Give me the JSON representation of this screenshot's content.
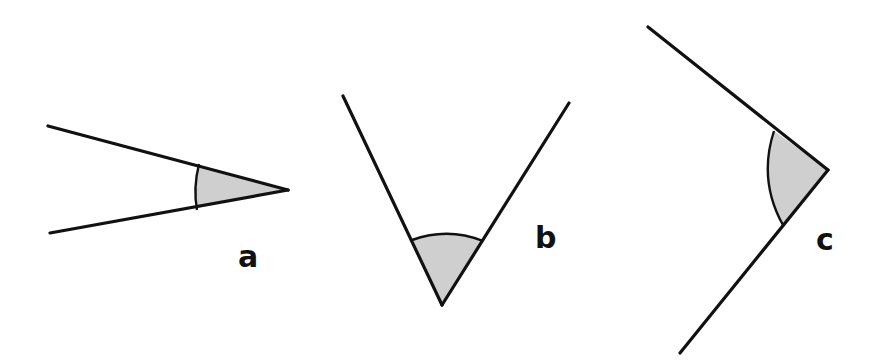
{
  "diagram": {
    "title": "",
    "colors": {
      "line": "#111111",
      "shade": "#cfcfcf",
      "background": "#ffffff"
    },
    "angles": [
      {
        "label": "a",
        "type": "acute",
        "shaded": true
      },
      {
        "label": "b",
        "type": "acute",
        "shaded": true
      },
      {
        "label": "c",
        "type": "right-ish",
        "shaded": true
      }
    ]
  }
}
